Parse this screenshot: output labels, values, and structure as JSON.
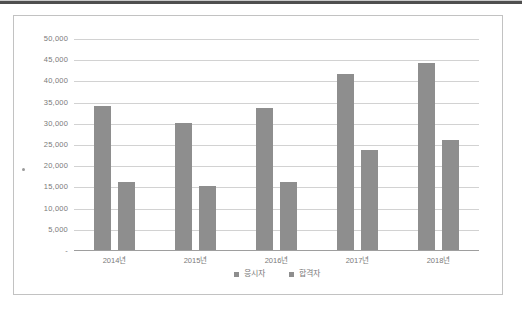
{
  "document": {
    "top_rule_color": "#4f4f4f",
    "background": "#ffffff"
  },
  "chart_data": {
    "type": "bar",
    "categories": [
      "2014년",
      "2015년",
      "2016년",
      "2017년",
      "2018년"
    ],
    "series": [
      {
        "name": "응시자",
        "values": [
          34000,
          30000,
          33500,
          41500,
          44000
        ]
      },
      {
        "name": "합격자",
        "values": [
          16000,
          15000,
          16000,
          23500,
          26000
        ]
      }
    ],
    "ylim": [
      0,
      50000
    ],
    "y_tick_step": 5000,
    "y_ticks": [
      {
        "value": 50000,
        "label": "50,000"
      },
      {
        "value": 45000,
        "label": "45,000"
      },
      {
        "value": 40000,
        "label": "40,000"
      },
      {
        "value": 35000,
        "label": "35,000"
      },
      {
        "value": 30000,
        "label": "30,000"
      },
      {
        "value": 25000,
        "label": "25,000"
      },
      {
        "value": 20000,
        "label": "20,000"
      },
      {
        "value": 15000,
        "label": "15,000"
      },
      {
        "value": 10000,
        "label": "10,000"
      },
      {
        "value": 5000,
        "label": "5,000"
      },
      {
        "value": 0,
        "label": "-"
      }
    ],
    "grid": true,
    "legend_position": "bottom-center",
    "colors": {
      "bar": "#8e8e8e",
      "gridline": "#d2d2d2",
      "axis_line": "#9e9e9e",
      "tick_label": "#7a7a7a",
      "frame_border": "#c2c2c2"
    }
  }
}
